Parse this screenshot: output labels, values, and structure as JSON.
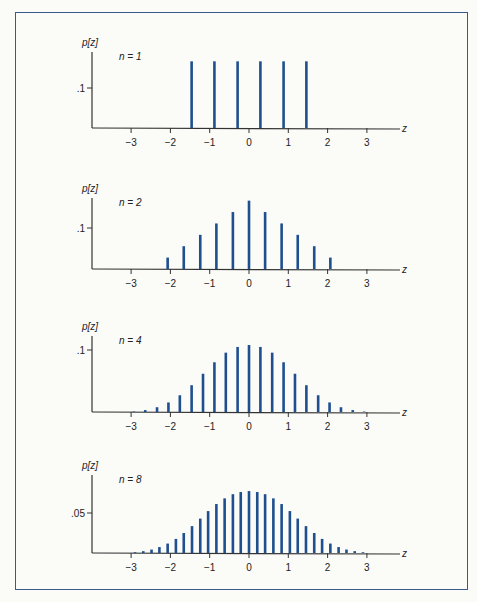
{
  "chart_data": [
    {
      "type": "bar",
      "title": "n = 1",
      "ylabel": "p[z]",
      "xlabel": "z",
      "ytick": {
        "label": ".1",
        "value": 0.1
      },
      "x": [
        -1.46,
        -0.88,
        -0.29,
        0.29,
        0.88,
        1.46
      ],
      "values": [
        0.1667,
        0.1667,
        0.1667,
        0.1667,
        0.1667,
        0.1667
      ],
      "xticks": [
        -3,
        -2,
        -1,
        0,
        1,
        2,
        3
      ],
      "xlim": [
        -3.8,
        3.9
      ]
    },
    {
      "type": "bar",
      "title": "n = 2",
      "ylabel": "p[z]",
      "xlabel": "z",
      "ytick": {
        "label": ".1",
        "value": 0.1
      },
      "x": [
        -2.07,
        -1.66,
        -1.24,
        -0.83,
        -0.41,
        0,
        0.41,
        0.83,
        1.24,
        1.66,
        2.07
      ],
      "values": [
        0.0278,
        0.0556,
        0.0833,
        0.1111,
        0.1389,
        0.1667,
        0.1389,
        0.1111,
        0.0833,
        0.0556,
        0.0278
      ],
      "xticks": [
        -3,
        -2,
        -1,
        0,
        1,
        2,
        3
      ],
      "xlim": [
        -3.8,
        3.9
      ]
    },
    {
      "type": "bar",
      "title": "n = 4",
      "ylabel": "p[z]",
      "xlabel": "z",
      "ytick": {
        "label": ".1",
        "value": 0.1
      },
      "x": [
        -2.93,
        -2.64,
        -2.34,
        -2.05,
        -1.76,
        -1.46,
        -1.17,
        -0.88,
        -0.59,
        -0.29,
        0,
        0.29,
        0.59,
        0.88,
        1.17,
        1.46,
        1.76,
        2.05,
        2.34,
        2.64,
        2.93
      ],
      "values": [
        0.0008,
        0.0031,
        0.0077,
        0.0154,
        0.027,
        0.0432,
        0.0617,
        0.0802,
        0.0957,
        0.1049,
        0.108,
        0.1049,
        0.0957,
        0.0802,
        0.0617,
        0.0432,
        0.027,
        0.0154,
        0.0077,
        0.0031,
        0.0008
      ],
      "xticks": [
        -3,
        -2,
        -1,
        0,
        1,
        2,
        3
      ],
      "xlim": [
        -3.8,
        3.9
      ]
    },
    {
      "type": "bar",
      "title": "n = 8",
      "ylabel": "p[z]",
      "xlabel": "z",
      "ytick": {
        "label": ".05",
        "value": 0.05
      },
      "x": [
        -2.9,
        -2.69,
        -2.48,
        -2.28,
        -2.07,
        -1.86,
        -1.66,
        -1.45,
        -1.24,
        -1.04,
        -0.83,
        -0.62,
        -0.41,
        -0.21,
        0,
        0.21,
        0.41,
        0.62,
        0.83,
        1.04,
        1.24,
        1.45,
        1.66,
        1.86,
        2.07,
        2.28,
        2.48,
        2.69,
        2.9
      ],
      "values": [
        0.001,
        0.0023,
        0.0043,
        0.0074,
        0.0118,
        0.0176,
        0.025,
        0.0336,
        0.043,
        0.0524,
        0.0612,
        0.0683,
        0.0735,
        0.0762,
        0.0774,
        0.0762,
        0.0735,
        0.0683,
        0.0612,
        0.0524,
        0.043,
        0.0336,
        0.025,
        0.0176,
        0.0118,
        0.0074,
        0.0043,
        0.0023,
        0.001
      ],
      "xticks": [
        -3,
        -2,
        -1,
        0,
        1,
        2,
        3
      ],
      "xlim": [
        -3.8,
        3.9
      ]
    }
  ],
  "panels": [
    {
      "n_label": "n = 1",
      "ylabel": "p[z]",
      "ytick_label": ".1",
      "xlabel": "z"
    },
    {
      "n_label": "n = 2",
      "ylabel": "p[z]",
      "ytick_label": ".1",
      "xlabel": "z"
    },
    {
      "n_label": "n = 4",
      "ylabel": "p[z]",
      "ytick_label": ".1",
      "xlabel": "z"
    },
    {
      "n_label": "n = 8",
      "ylabel": "p[z]",
      "ytick_label": ".05",
      "xlabel": "z"
    }
  ],
  "xtick_labels": [
    "−3",
    "−2",
    "−1",
    "0",
    "1",
    "2",
    "3"
  ],
  "colors": {
    "bar": "#1f4f8f",
    "axis": "#333333",
    "frame": "#3b5a8c"
  }
}
